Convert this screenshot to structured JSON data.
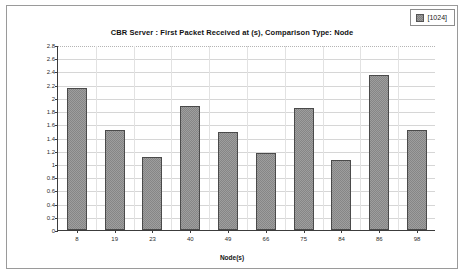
{
  "legend": {
    "swatch_icon": "series-swatch-icon",
    "label": "[1024]"
  },
  "chart_data": {
    "type": "bar",
    "title": "CBR Server :  First Packet Received at (s), Comparison Type: Node",
    "xlabel": "Node(s)",
    "ylabel": "Metric Value",
    "categories": [
      "8",
      "19",
      "23",
      "40",
      "49",
      "66",
      "75",
      "84",
      "86",
      "98"
    ],
    "values": [
      2.15,
      1.52,
      1.11,
      1.88,
      1.49,
      1.17,
      1.84,
      1.06,
      2.35,
      1.51
    ],
    "series": [
      {
        "name": "[1024]",
        "values": [
          2.15,
          1.52,
          1.11,
          1.88,
          1.49,
          1.17,
          1.84,
          1.06,
          2.35,
          1.51
        ]
      }
    ],
    "ylim": [
      0,
      2.8
    ],
    "yticks": [
      "0",
      "0.2",
      "0.4",
      "0.6",
      "0.8",
      "1",
      "1.2",
      "1.4",
      "1.6",
      "1.8",
      "2",
      "2.2",
      "2.4",
      "2.6",
      "2.8"
    ],
    "ytick_values": [
      0,
      0.2,
      0.4,
      0.6,
      0.8,
      1,
      1.2,
      1.4,
      1.6,
      1.8,
      2,
      2.2,
      2.4,
      2.6,
      2.8
    ],
    "grid": true,
    "legend_position": "top-right",
    "bar_color": "#9e9e9e",
    "bar_border_color": "#4a4a4a",
    "grid_color": "#d6d6d6",
    "axis_color": "#3c3c3c"
  }
}
